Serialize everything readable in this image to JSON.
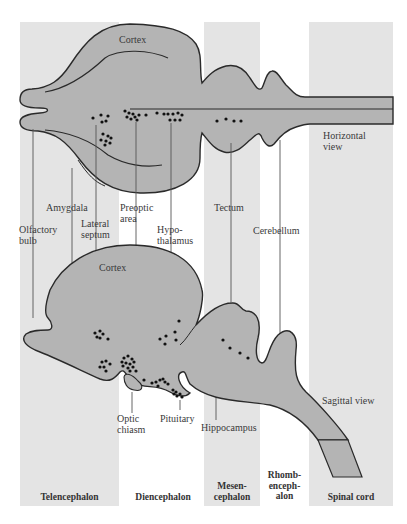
{
  "colors": {
    "band": "#e4e4e4",
    "brain_fill": "#b4b4b4",
    "outline": "#2a2a2a",
    "leader": "#555555",
    "dot": "#111111",
    "text": "#3a3a3a"
  },
  "views": {
    "horizontal": "Horizontal\nview",
    "sagittal": "Sagittal view"
  },
  "structure_labels": {
    "cortex_top": "Cortex",
    "cortex_sagittal": "Cortex",
    "olfactory_bulb": "Olfactory\nbulb",
    "amygdala": "Amygdala",
    "lateral_septum": "Lateral\nseptum",
    "preoptic_area": "Preoptic\narea",
    "hypothalamus": "Hypo-\nthalamus",
    "tectum": "Tectum",
    "cerebellum": "Cerebellum",
    "optic_chiasm": "Optic\nchiasm",
    "pituitary": "Pituitary",
    "hippocampus": "Hippocampus"
  },
  "regions": [
    {
      "key": "telencephalon",
      "label": "Telencephalon",
      "shaded": true
    },
    {
      "key": "diencephalon",
      "label": "Diencephalon",
      "shaded": false
    },
    {
      "key": "mesencephalon",
      "label": "Mesen-\ncephalon",
      "shaded": true
    },
    {
      "key": "rhombencephalon",
      "label": "Rhomb-\nenceph-\nalon",
      "shaded": false
    },
    {
      "key": "spinal_cord",
      "label": "Spinal cord",
      "shaded": true
    }
  ]
}
